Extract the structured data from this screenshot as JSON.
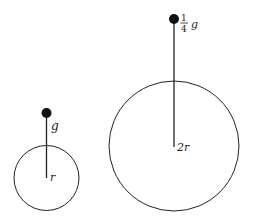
{
  "diagram": {
    "colors": {
      "stroke": "#222222",
      "background": "#ffffff"
    },
    "small_planet": {
      "center_label": "r",
      "object_label": "g"
    },
    "large_planet": {
      "center_label": "2r",
      "object_label_fraction_num": "1",
      "object_label_fraction_den": "4",
      "object_label_symbol": "g"
    }
  }
}
